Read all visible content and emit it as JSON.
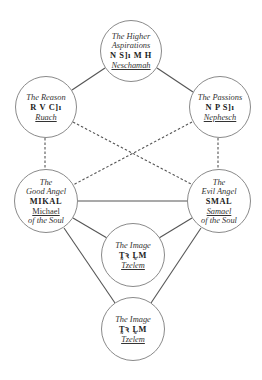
{
  "diagram": {
    "colors": {
      "line": "#555555",
      "circle_border": "#8a8a8a",
      "text": "#2a2a2a",
      "background": "#ffffff"
    },
    "nodes": [
      {
        "id": "neschamah",
        "title_lines": [
          "The Higher",
          "Aspirations"
        ],
        "hebrew": "N S]ı M H",
        "name": "Neschamah",
        "name_style": "italic-underline",
        "center": [
          131,
          51
        ]
      },
      {
        "id": "ruach",
        "title_lines": [
          "The Reason"
        ],
        "hebrew": "R V C]ı",
        "name": "Ruach",
        "name_style": "italic-underline",
        "center": [
          46,
          107
        ]
      },
      {
        "id": "nephesch",
        "title_lines": [
          "The Passions"
        ],
        "hebrew": "N P S]ı",
        "name": "Nephesch",
        "name_style": "italic-underline",
        "center": [
          220,
          107
        ]
      },
      {
        "id": "mikal",
        "title_lines": [
          "The",
          "Good Angel"
        ],
        "hebrew": "MIKAL",
        "name": "Michael",
        "name_style": "underline",
        "subtitle": "of the Soul",
        "center": [
          46,
          201
        ]
      },
      {
        "id": "smal",
        "title_lines": [
          "The",
          "Evil Angel"
        ],
        "hebrew": "SMAL",
        "name": "Samael",
        "name_style": "italic-underline",
        "subtitle": "of the Soul",
        "center": [
          219,
          201
        ]
      },
      {
        "id": "tzelem-1",
        "title_lines": [
          "The Image"
        ],
        "hebrew": "T̰ꝛ L̰M",
        "name": "Tzelem",
        "name_style": "italic-underline",
        "center": [
          133,
          255
        ]
      },
      {
        "id": "tzelem-2",
        "title_lines": [
          "The Image"
        ],
        "hebrew": "T̰ꝛ L̰M",
        "name": "Tzelem",
        "name_style": "italic-underline",
        "center": [
          133,
          330
        ]
      }
    ],
    "edges": [
      {
        "from": "neschamah",
        "to": "ruach",
        "style": "solid"
      },
      {
        "from": "neschamah",
        "to": "nephesch",
        "style": "solid"
      },
      {
        "from": "ruach",
        "to": "mikal",
        "style": "dashed"
      },
      {
        "from": "nephesch",
        "to": "smal",
        "style": "dashed"
      },
      {
        "from": "ruach",
        "to": "smal",
        "style": "dashed"
      },
      {
        "from": "nephesch",
        "to": "mikal",
        "style": "dashed"
      },
      {
        "from": "mikal",
        "to": "smal",
        "style": "solid"
      },
      {
        "from": "mikal",
        "to": "tzelem-1",
        "style": "solid"
      },
      {
        "from": "smal",
        "to": "tzelem-1",
        "style": "solid"
      },
      {
        "from": "mikal",
        "to": "tzelem-2",
        "style": "solid"
      },
      {
        "from": "smal",
        "to": "tzelem-2",
        "style": "solid"
      }
    ]
  },
  "n0": {
    "t1": "The Higher",
    "t2": "Aspirations",
    "heb": "N S]ı M H",
    "name": "Neschamah"
  },
  "n1": {
    "t1": "The Reason",
    "heb": "R V C]ı",
    "name": "Ruach"
  },
  "n2": {
    "t1": "The Passions",
    "heb": "N P S]ı",
    "name": "Nephesch"
  },
  "n3": {
    "t1": "The",
    "t2": "Good Angel",
    "heb": "MIKAL",
    "name": "Michael",
    "sub": "of the Soul"
  },
  "n4": {
    "t1": "The",
    "t2": "Evil Angel",
    "heb": "SMAL",
    "name": "Samael",
    "sub": "of the Soul"
  },
  "n5": {
    "t1": "The Image",
    "heb": "T̰ꝛ L̰M",
    "name": "Tzelem"
  },
  "n6": {
    "t1": "The Image",
    "heb": "T̰ꝛ L̰M",
    "name": "Tzelem"
  }
}
